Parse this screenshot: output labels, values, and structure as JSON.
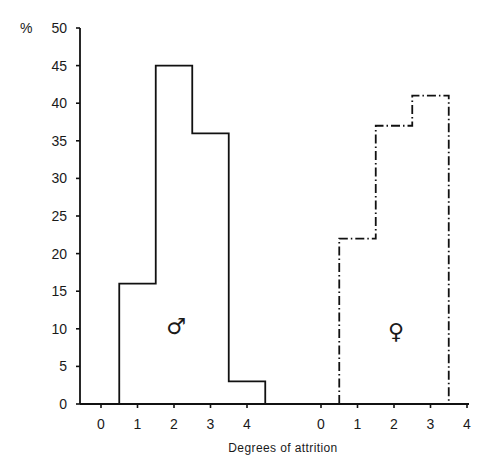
{
  "chart_data": {
    "type": "bar",
    "subtype": "step-histogram",
    "title": "",
    "xlabel": "Degrees of attrition",
    "ylabel": "%",
    "ylim": [
      0,
      50
    ],
    "yticks": [
      0,
      5,
      10,
      15,
      20,
      25,
      30,
      35,
      40,
      45,
      50
    ],
    "categories": [
      "0",
      "1",
      "2",
      "3",
      "4"
    ],
    "grid": false,
    "legend": "none (panels labelled with sex symbols)",
    "series": [
      {
        "name": "Male",
        "symbol": "♂",
        "line_style": "solid",
        "values": [
          0,
          16,
          45,
          36,
          3
        ]
      },
      {
        "name": "Female",
        "symbol": "♀",
        "line_style": "dash-dot",
        "values": [
          0,
          22,
          37,
          41,
          0
        ]
      }
    ]
  },
  "labels": {
    "y_unit": "%",
    "x_title": "Degrees of attrition",
    "male_symbol": "♂",
    "female_symbol": "♀"
  }
}
